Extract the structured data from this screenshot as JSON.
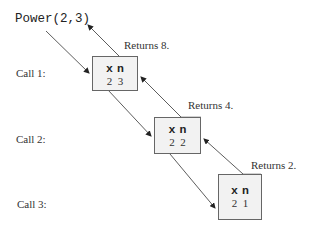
{
  "diagram": {
    "initial_call": "Power(2,3)",
    "frames": [
      {
        "call_label": "Call 1:",
        "headers": [
          "x",
          "n"
        ],
        "values": [
          "2",
          "3"
        ],
        "returns": "Returns 8."
      },
      {
        "call_label": "Call 2:",
        "headers": [
          "x",
          "n"
        ],
        "values": [
          "2",
          "2"
        ],
        "returns": "Returns 4."
      },
      {
        "call_label": "Call 3:",
        "headers": [
          "x",
          "n"
        ],
        "values": [
          "2",
          "1"
        ],
        "returns": "Returns 2."
      }
    ],
    "colors": {
      "frame_fill": "#f2f2f2",
      "frame_border": "#666666",
      "arrow": "#333333",
      "text": "#333333"
    }
  }
}
